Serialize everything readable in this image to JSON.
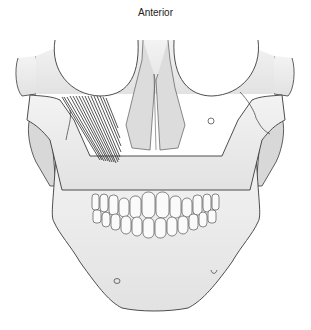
{
  "figure": {
    "title": "Anterior",
    "colors": {
      "bone_fill": "#e9e9e9",
      "bone_shadow": "#d2d2d2",
      "outline": "#3a3a3a",
      "muscle": "#2a2a2a",
      "teeth": "#fafafa"
    }
  }
}
